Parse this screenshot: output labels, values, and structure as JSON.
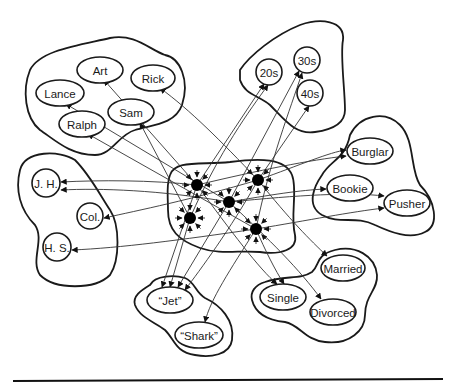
{
  "diagram": {
    "pools": [
      {
        "id": "names",
        "label": "Names"
      },
      {
        "id": "ages",
        "label": "Ages"
      },
      {
        "id": "occupations",
        "label": "Occupations"
      },
      {
        "id": "marital",
        "label": "Marital Status"
      },
      {
        "id": "gangs",
        "label": "Gangs"
      },
      {
        "id": "education",
        "label": "Education"
      },
      {
        "id": "instances",
        "label": "Instance units"
      }
    ],
    "nodes": [
      {
        "id": "art",
        "label": "Art",
        "shape": "ellipse",
        "cx": 100,
        "cy": 70,
        "rx": 23,
        "ry": 13
      },
      {
        "id": "rick",
        "label": "Rick",
        "shape": "ellipse",
        "cx": 153,
        "cy": 78,
        "rx": 22,
        "ry": 13
      },
      {
        "id": "lance",
        "label": "Lance",
        "shape": "ellipse",
        "cx": 60,
        "cy": 93,
        "rx": 24,
        "ry": 13
      },
      {
        "id": "sam",
        "label": "Sam",
        "shape": "ellipse",
        "cx": 131,
        "cy": 112,
        "rx": 23,
        "ry": 13
      },
      {
        "id": "ralph",
        "label": "Ralph",
        "shape": "ellipse",
        "cx": 82,
        "cy": 124,
        "rx": 23,
        "ry": 13
      },
      {
        "id": "20s",
        "label": "20s",
        "shape": "circle",
        "cx": 269,
        "cy": 72,
        "rx": 13,
        "ry": 13
      },
      {
        "id": "30s",
        "label": "30s",
        "shape": "circle",
        "cx": 307,
        "cy": 60,
        "rx": 13,
        "ry": 13
      },
      {
        "id": "40s",
        "label": "40s",
        "shape": "circle",
        "cx": 310,
        "cy": 93,
        "rx": 13,
        "ry": 13
      },
      {
        "id": "jh",
        "label": "J. H.",
        "shape": "circle",
        "cx": 46,
        "cy": 183,
        "rx": 14,
        "ry": 14
      },
      {
        "id": "col",
        "label": "Col.",
        "shape": "circle",
        "cx": 90,
        "cy": 216,
        "rx": 13,
        "ry": 13
      },
      {
        "id": "hs",
        "label": "H. S.",
        "shape": "circle",
        "cx": 57,
        "cy": 247,
        "rx": 14,
        "ry": 14
      },
      {
        "id": "burglar",
        "label": "Burglar",
        "shape": "ellipse",
        "cx": 370,
        "cy": 151,
        "rx": 23,
        "ry": 13
      },
      {
        "id": "bookie",
        "label": "Bookie",
        "shape": "ellipse",
        "cx": 350,
        "cy": 188,
        "rx": 23,
        "ry": 13
      },
      {
        "id": "pusher",
        "label": "Pusher",
        "shape": "ellipse",
        "cx": 407,
        "cy": 203,
        "rx": 23,
        "ry": 13
      },
      {
        "id": "married",
        "label": "Married",
        "shape": "ellipse",
        "cx": 343,
        "cy": 268,
        "rx": 22,
        "ry": 13
      },
      {
        "id": "single",
        "label": "Single",
        "shape": "ellipse",
        "cx": 283,
        "cy": 297,
        "rx": 23,
        "ry": 13
      },
      {
        "id": "divorced",
        "label": "Divorced",
        "shape": "ellipse",
        "cx": 333,
        "cy": 312,
        "rx": 23,
        "ry": 13
      },
      {
        "id": "jet",
        "label": "“Jet”",
        "shape": "ellipse",
        "cx": 170,
        "cy": 300,
        "rx": 23,
        "ry": 13
      },
      {
        "id": "shark",
        "label": "“Shark”",
        "shape": "ellipse",
        "cx": 199,
        "cy": 335,
        "rx": 24,
        "ry": 13
      }
    ],
    "hidden_units": [
      {
        "id": "h1",
        "cx": 197,
        "cy": 185
      },
      {
        "id": "h2",
        "cx": 258,
        "cy": 180
      },
      {
        "id": "h3",
        "cx": 229,
        "cy": 202
      },
      {
        "id": "h4",
        "cx": 190,
        "cy": 218
      },
      {
        "id": "h5",
        "cx": 256,
        "cy": 229
      }
    ],
    "blobs": [
      {
        "id": "names-pool",
        "d": "M30,70 C40,50 80,45 110,38 C135,33 150,50 165,55 C180,58 190,80 182,105 C175,125 150,125 135,130 C118,135 112,155 95,155 C70,155 55,140 40,130 C25,118 22,90 30,70 Z"
      },
      {
        "id": "ages-pool",
        "d": "M240,70 C250,55 275,35 300,25 C320,18 345,20 343,40 C340,55 345,90 345,110 C345,125 330,130 315,132 C295,135 285,120 270,105 C258,95 245,95 240,80 Z"
      },
      {
        "id": "education-pool",
        "d": "M20,170 C25,150 60,150 75,160 C90,175 100,195 110,210 C120,225 120,260 110,275 C95,290 55,290 40,275 C30,260 45,240 35,225 C20,210 15,190 20,170 Z"
      },
      {
        "id": "occupations-pool",
        "d": "M350,135 C360,115 385,110 400,125 C415,140 410,170 420,185 C435,200 440,225 425,232 C410,240 390,232 375,225 C355,215 340,225 322,215 C305,205 315,185 322,175 C330,160 345,160 350,135 Z"
      },
      {
        "id": "instances-pool",
        "d": "M170,175 C175,160 200,165 230,162 C260,158 285,158 292,175 C298,190 290,215 295,235 C298,250 280,255 260,252 C240,250 220,255 200,248 C178,240 168,230 168,210 C168,195 166,185 170,175 Z"
      },
      {
        "id": "marital-pool",
        "d": "M265,282 C285,275 300,280 312,272 C320,265 315,255 335,250 C355,245 375,255 377,275 C378,290 365,295 365,315 C365,330 350,345 325,342 C305,340 300,325 285,322 C265,320 255,312 252,300 C250,292 255,285 265,282 Z"
      },
      {
        "id": "gangs-pool",
        "d": "M150,285 C155,275 175,275 185,278 C195,282 195,292 205,298 C220,305 235,320 232,340 C230,355 210,358 195,355 C175,352 175,340 165,330 C155,322 140,318 135,305 C132,296 142,290 150,285 Z"
      }
    ],
    "edges": [
      {
        "d": "M197,185 L104,80",
        "head": "end"
      },
      {
        "d": "M258,180 C220,140 190,110 160,88",
        "head": "end"
      },
      {
        "d": "M229,202 L66,104",
        "head": "end"
      },
      {
        "d": "M190,218 L140,123",
        "head": "end"
      },
      {
        "d": "M256,229 L88,134",
        "head": "end"
      },
      {
        "d": "M197,185 L264,84",
        "head": "end"
      },
      {
        "d": "M190,218 C220,150 250,110 268,85",
        "head": "end"
      },
      {
        "d": "M229,202 L299,71",
        "head": "end"
      },
      {
        "d": "M256,229 C270,160 290,110 302,73",
        "head": "end"
      },
      {
        "d": "M258,180 L309,106",
        "head": "end"
      },
      {
        "d": "M197,185 C150,180 100,180 61,182",
        "head": "end"
      },
      {
        "d": "M229,202 C160,190 100,188 61,190",
        "head": "end"
      },
      {
        "d": "M258,180 C190,200 140,210 104,218",
        "head": "end"
      },
      {
        "d": "M256,229 C180,240 120,248 72,250",
        "head": "end"
      },
      {
        "d": "M258,180 C300,165 330,152 346,150",
        "head": "end"
      },
      {
        "d": "M197,185 C260,170 310,160 346,156",
        "head": "end"
      },
      {
        "d": "M229,202 C270,195 300,190 326,189",
        "head": "end"
      },
      {
        "d": "M229,202 C300,195 350,192 384,196",
        "head": "end"
      },
      {
        "d": "M256,229 C310,220 350,212 384,208",
        "head": "end"
      },
      {
        "d": "M197,185 C230,230 260,270 277,284",
        "head": "end"
      },
      {
        "d": "M256,229 C265,250 275,270 284,284",
        "head": "end"
      },
      {
        "d": "M258,180 C290,220 310,240 327,256",
        "head": "end"
      },
      {
        "d": "M229,202 C270,240 300,270 321,299",
        "head": "end"
      },
      {
        "d": "M197,185 L162,287",
        "head": "end"
      },
      {
        "d": "M190,218 L170,287",
        "head": "end"
      },
      {
        "d": "M229,202 L178,287",
        "head": "end"
      },
      {
        "d": "M258,180 C230,230 200,270 185,290",
        "head": "end"
      },
      {
        "d": "M256,229 C230,270 210,300 205,322",
        "head": "end"
      }
    ]
  },
  "footer": {
    "rule": "horizontal-separator"
  }
}
